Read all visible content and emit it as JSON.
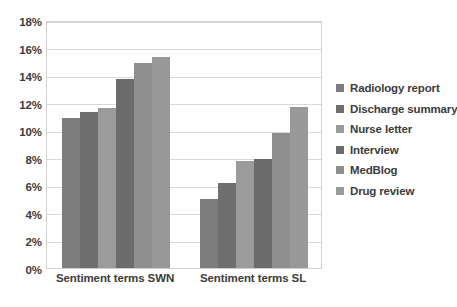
{
  "chart_data": {
    "type": "bar",
    "title": "",
    "subtitle": "",
    "xlabel": "",
    "ylabel": "",
    "categories": [
      "Sentiment terms SWN",
      "Sentiment terms SL"
    ],
    "series": [
      {
        "name": "Radiology report",
        "values": [
          10.9,
          5.0
        ],
        "color": "#7d7d7d"
      },
      {
        "name": "Discharge summary",
        "values": [
          11.3,
          6.2
        ],
        "color": "#6e6e6e"
      },
      {
        "name": "Nurse letter",
        "values": [
          11.6,
          7.8
        ],
        "color": "#9b9b9b"
      },
      {
        "name": "Interview",
        "values": [
          13.7,
          7.9
        ],
        "color": "#6b6b6b"
      },
      {
        "name": "MedBlog",
        "values": [
          14.9,
          9.8
        ],
        "color": "#8f8f8f"
      },
      {
        "name": "Drug review",
        "values": [
          15.3,
          11.7
        ],
        "color": "#999999"
      }
    ],
    "ylim": [
      0,
      18
    ],
    "ytick_step": 2,
    "ytick_labels": [
      "0%",
      "2%",
      "4%",
      "6%",
      "8%",
      "10%",
      "12%",
      "14%",
      "16%",
      "18%"
    ],
    "grid": true,
    "legend_position": "right",
    "annotations": []
  },
  "colors": {
    "plot_border": "#d0d0d0",
    "gridline": "#d9d9d9",
    "text": "#3c3c3c",
    "background": "#ffffff"
  }
}
